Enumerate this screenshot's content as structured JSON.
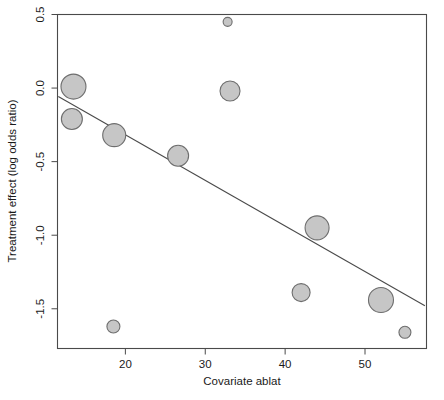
{
  "chart_data": {
    "type": "scatter",
    "title": "",
    "subtitle": "",
    "xlabel": "Covariate ablat",
    "ylabel": "Treatment effect (log odds ratio)",
    "xlim": [
      11.5,
      57.7
    ],
    "ylim": [
      -1.77,
      0.5
    ],
    "xticks": [
      20,
      30,
      40,
      50
    ],
    "xtick_labels": [
      "20",
      "30",
      "40",
      "50"
    ],
    "yticks": [
      0.5,
      0.0,
      -0.5,
      -1.0,
      -1.5
    ],
    "ytick_labels": [
      "0.5",
      "0.0",
      "-0.5",
      "-1.0",
      "-1.5"
    ],
    "grid": false,
    "legend": null,
    "series": [
      {
        "name": "studies",
        "marker": "circle",
        "fill_color": "#c6c6c6",
        "edge_color": "#6e6e6e",
        "size_encoding": "precision (inverse variance) of study",
        "points": [
          {
            "x": 13.5,
            "y": 0.01,
            "size": 12.5
          },
          {
            "x": 13.3,
            "y": -0.21,
            "size": 10.5
          },
          {
            "x": 18.6,
            "y": -0.32,
            "size": 11.5
          },
          {
            "x": 26.6,
            "y": -0.46,
            "size": 10.5
          },
          {
            "x": 32.8,
            "y": 0.45,
            "size": 4.5
          },
          {
            "x": 33.1,
            "y": -0.02,
            "size": 10.0
          },
          {
            "x": 18.5,
            "y": -1.62,
            "size": 6.5
          },
          {
            "x": 44.0,
            "y": -0.95,
            "size": 12.0
          },
          {
            "x": 42.0,
            "y": -1.39,
            "size": 9.0
          },
          {
            "x": 52.0,
            "y": -1.44,
            "size": 12.5
          },
          {
            "x": 55.0,
            "y": -1.66,
            "size": 6.0
          }
        ]
      }
    ],
    "fit_line": {
      "name": "meta-regression line",
      "color": "#4a4a4a",
      "x_start": 11.6,
      "y_start": -0.057,
      "x_end": 57.5,
      "y_end": -1.48
    }
  },
  "axes": {
    "x_title": "Covariate ablat",
    "y_title": "Treatment effect (log odds ratio)"
  }
}
